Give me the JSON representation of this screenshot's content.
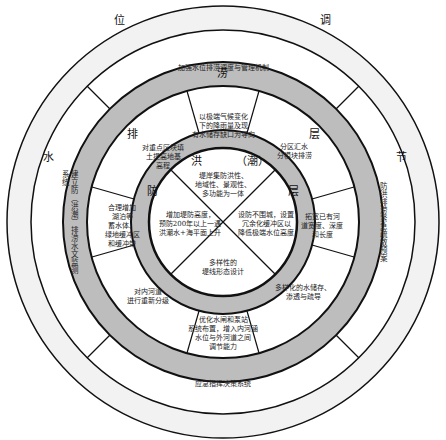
{
  "diagram": {
    "type": "concentric-ring-framework",
    "colors": {
      "outer_band": "#f2f2f2",
      "mid_band": "#bdbdbd",
      "inner_band": "#bdbdbd",
      "background": "#ffffff",
      "stroke": "#111111"
    },
    "outer_ring": {
      "labels": [
        "位",
        "调",
        "节",
        "水"
      ],
      "segments": [
        "加强水位排涝调度与管理机制",
        "防洪排涝紧急疏散预案",
        "应急指挥决策系统",
        "建立防（洪潮）排涝水文监测系统"
      ]
    },
    "middle_ring": {
      "labels": [
        "排",
        "涝",
        "层"
      ],
      "segments": [
        "以极端气候变化\n下的降雨量及现\n有水储存缺口为导向",
        "分区汇水\n分模块排涝",
        "拓宽已有河\n道宽度、深度\n和长度",
        "多样化的水储存、\n渗透与疏导",
        "优化水闸和泵站\n系统布置，增入内河涵\n水位与外河道之间\n调节能力",
        "对内河道\n进行重新分级",
        "合理增加\n湖泊等\n蓄水体、\n绿地缓冲区\n和缓冲带",
        "对重点区块填\n土提高地基\n高程"
      ]
    },
    "inner_ring": {
      "labels": [
        "洪",
        "（潮）",
        "防",
        "层"
      ]
    },
    "core": {
      "segments": [
        "堤岸集防洪性、\n地域性、景观性、\n多功能为一体",
        "设防不围城，设置\n冗余化缓冲区以\n降低极端水位高度",
        "多样性的\n堤线形态设计",
        "增加堤防高度，\n预防200年以上一遇\n洪潮水+海平面上升"
      ]
    }
  }
}
